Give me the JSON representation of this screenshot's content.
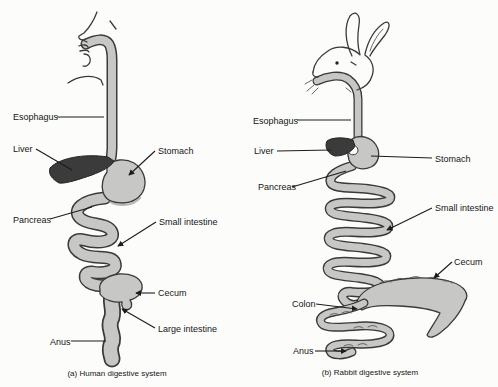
{
  "figure": {
    "colors": {
      "background": "#fcfcfb",
      "organ_fill": "#c7c8c5",
      "liver_fill": "#3b3b3b",
      "outline": "#3a3a3a",
      "text": "#161616"
    },
    "human": {
      "caption": "(a) Human digestive system",
      "labels": {
        "esophagus": "Esophagus",
        "liver": "Liver",
        "stomach": "Stomach",
        "pancreas": "Pancreas",
        "small_intestine": "Small intestine",
        "cecum": "Cecum",
        "large_intestine": "Large intestine",
        "anus": "Anus"
      }
    },
    "rabbit": {
      "caption": "(b) Rabbit digestive system",
      "labels": {
        "esophagus": "Esophagus",
        "liver": "Liver",
        "stomach": "Stomach",
        "pancreas": "Pancreas",
        "small_intestine": "Small intestine",
        "cecum": "Cecum",
        "colon": "Colon",
        "anus": "Anus"
      }
    }
  }
}
